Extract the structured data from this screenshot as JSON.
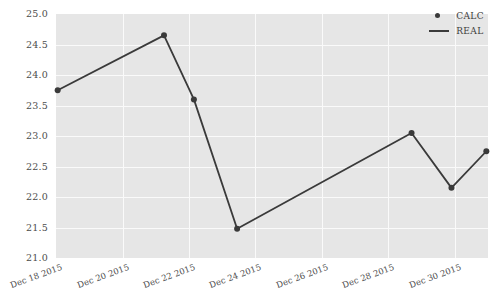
{
  "chart_data": {
    "type": "line",
    "title": "",
    "xlabel": "",
    "ylabel": "",
    "grid": true,
    "legend_position": "top-right",
    "xlim_labels": [
      "Dec 18 2015",
      "Dec 31 2015"
    ],
    "ylim": [
      21.0,
      25.0
    ],
    "y_ticks": [
      "25.0",
      "24.5",
      "24.0",
      "23.5",
      "23.0",
      "22.5",
      "22.0",
      "21.5",
      "21.0"
    ],
    "y_tick_values": [
      25.0,
      24.5,
      24.0,
      23.5,
      23.0,
      22.5,
      22.0,
      21.5,
      21.0
    ],
    "x_ticks": [
      "Dec 18 2015",
      "Dec 20 2015",
      "Dec 22 2015",
      "Dec 24 2015",
      "Dec 26 2015",
      "Dec 28 2015",
      "Dec 30 2015"
    ],
    "x_tick_values": [
      18,
      20,
      22,
      24,
      26,
      28,
      30
    ],
    "series": [
      {
        "name": "REAL",
        "style": "line",
        "color": "#3a3a3a",
        "x": [
          18.05,
          21.25,
          22.15,
          23.45,
          28.7,
          29.9,
          30.95
        ],
        "y": [
          23.75,
          24.65,
          23.6,
          21.48,
          23.05,
          22.15,
          22.75
        ]
      },
      {
        "name": "CALC",
        "style": "marker",
        "color": "#3a3a3a",
        "x": [
          18.05,
          21.25,
          22.15,
          23.45,
          28.7,
          29.9,
          30.95
        ],
        "y": [
          23.75,
          24.65,
          23.6,
          21.48,
          23.05,
          22.15,
          22.75
        ]
      }
    ],
    "points": [
      {
        "x": "Dec 18 2015",
        "y": 23.75
      },
      {
        "x": "Dec 21 2015",
        "y": 24.65
      },
      {
        "x": "Dec 22 2015",
        "y": 23.6
      },
      {
        "x": "Dec 23 2015",
        "y": 21.48
      },
      {
        "x": "Dec 29 2015",
        "y": 23.05
      },
      {
        "x": "Dec 30 2015",
        "y": 22.15
      },
      {
        "x": "Dec 31 2015",
        "y": 22.75
      }
    ]
  },
  "legend": {
    "entries": [
      {
        "label": "CALC",
        "marker": "dot"
      },
      {
        "label": "REAL",
        "marker": "line"
      }
    ]
  },
  "colors": {
    "panel_background": "#e6e6e6",
    "gridline": "#fafafa",
    "series": "#3a3a3a",
    "tick_text": "#4d4d4d",
    "page_background": "#ffffff"
  }
}
